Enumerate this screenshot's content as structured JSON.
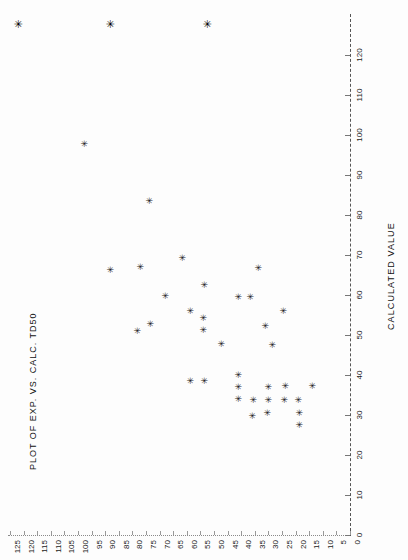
{
  "title": "PLOT OF EXP. VS. CALC. TD50",
  "axis": {
    "calculated_title": "CALCULATED VALUE",
    "experimental_ticks": [
      "125",
      "120",
      "115",
      "110",
      "105",
      "100",
      "95",
      "90",
      "85",
      "80",
      "75",
      "70",
      "65",
      "60",
      "55",
      "50",
      "45",
      "40",
      "35",
      "30",
      "25",
      "20",
      "15",
      "10",
      "5",
      "0"
    ],
    "calculated_ticks": [
      "0",
      "10",
      "20",
      "30",
      "40",
      "50",
      "60",
      "70",
      "80",
      "90",
      "100",
      "110",
      "120"
    ]
  },
  "marker_glyph": "✳",
  "colors": {
    "background": "#fdfdfd",
    "ink": "#1b1b1b",
    "axis": "#555555"
  },
  "chart_data": {
    "type": "scatter",
    "title": "PLOT OF EXP. VS. CALC. TD50",
    "xlabel": "CALCULATED VALUE",
    "ylabel": "EXPERIMENTAL VALUE",
    "orientation": "rotated-90",
    "xlim": [
      0,
      125
    ],
    "ylim": [
      0,
      125
    ],
    "grid": false,
    "legend": null,
    "x": [
      122,
      88,
      52,
      97,
      82,
      73,
      66,
      61,
      61,
      58,
      54,
      53,
      52,
      48,
      46,
      45,
      43,
      41,
      40,
      39,
      38,
      37,
      36,
      34,
      33,
      33,
      32,
      31,
      30,
      29,
      28,
      27,
      26,
      25,
      24,
      23,
      22,
      20
    ],
    "y": [
      128,
      128,
      128,
      104,
      88,
      76,
      64,
      61,
      57,
      47,
      52,
      51,
      44,
      63,
      46,
      43,
      52,
      47,
      40,
      42,
      46,
      37,
      33,
      50,
      38,
      34,
      44,
      35,
      32,
      36,
      33,
      31,
      33,
      30,
      32,
      31,
      29,
      30
    ],
    "point_count": 38,
    "note": "Three points lie above the plotted calculated-value range (clipped at top)."
  },
  "points_px": [
    {
      "x": 17,
      "y": 24,
      "big": true
    },
    {
      "x": 109,
      "y": 24,
      "big": true
    },
    {
      "x": 206,
      "y": 24,
      "big": true
    },
    {
      "x": 84,
      "y": 144,
      "big": false
    },
    {
      "x": 149,
      "y": 201,
      "big": false
    },
    {
      "x": 140,
      "y": 267,
      "big": false
    },
    {
      "x": 110,
      "y": 270,
      "big": false
    },
    {
      "x": 204,
      "y": 285,
      "big": false
    },
    {
      "x": 182,
      "y": 258,
      "big": false
    },
    {
      "x": 190,
      "y": 311,
      "big": false
    },
    {
      "x": 150,
      "y": 324,
      "big": false
    },
    {
      "x": 137,
      "y": 331,
      "big": false
    },
    {
      "x": 238,
      "y": 297,
      "big": false
    },
    {
      "x": 250,
      "y": 297,
      "big": false
    },
    {
      "x": 258,
      "y": 268,
      "big": false
    },
    {
      "x": 265,
      "y": 326,
      "big": false
    },
    {
      "x": 283,
      "y": 311,
      "big": false
    },
    {
      "x": 203,
      "y": 318,
      "big": false
    },
    {
      "x": 203,
      "y": 330,
      "big": false
    },
    {
      "x": 272,
      "y": 345,
      "big": false
    },
    {
      "x": 190,
      "y": 381,
      "big": false
    },
    {
      "x": 204,
      "y": 381,
      "big": false
    },
    {
      "x": 238,
      "y": 375,
      "big": false
    },
    {
      "x": 238,
      "y": 387,
      "big": false
    },
    {
      "x": 238,
      "y": 399,
      "big": false
    },
    {
      "x": 253,
      "y": 400,
      "big": false
    },
    {
      "x": 268,
      "y": 387,
      "big": false
    },
    {
      "x": 268,
      "y": 400,
      "big": false
    },
    {
      "x": 267,
      "y": 413,
      "big": false
    },
    {
      "x": 284,
      "y": 400,
      "big": false
    },
    {
      "x": 285,
      "y": 386,
      "big": false
    },
    {
      "x": 298,
      "y": 400,
      "big": false
    },
    {
      "x": 299,
      "y": 413,
      "big": false
    },
    {
      "x": 299,
      "y": 425,
      "big": false
    },
    {
      "x": 312,
      "y": 386,
      "big": false
    },
    {
      "x": 221,
      "y": 344,
      "big": false
    },
    {
      "x": 252,
      "y": 416,
      "big": false
    },
    {
      "x": 165,
      "y": 296,
      "big": false
    }
  ]
}
